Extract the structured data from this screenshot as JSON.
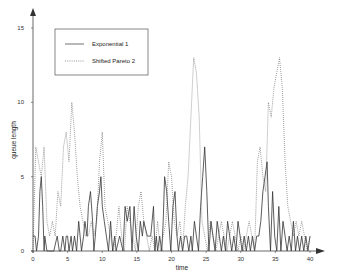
{
  "chart_data": {
    "type": "line",
    "title": "",
    "xlabel": "time",
    "ylabel": "queue length",
    "xlim": [
      0,
      40
    ],
    "ylim": [
      0,
      15
    ],
    "x_ticks": [
      "0",
      "5",
      "10",
      "15",
      "20",
      "25",
      "30",
      "35",
      "40"
    ],
    "y_ticks": [
      "0",
      "5",
      "10",
      "15"
    ],
    "grid": false,
    "legend_position": "upper-left",
    "series": [
      {
        "name": "Exponential 1",
        "style": "solid",
        "x": [
          0,
          0.3,
          0.5,
          0.8,
          1.0,
          1.2,
          1.4,
          1.6,
          1.7,
          2.0,
          2.2,
          2.4,
          2.6,
          3.0,
          3.5,
          3.8,
          4.0,
          4.3,
          4.6,
          4.8,
          5.0,
          5.2,
          5.5,
          5.7,
          6.0,
          6.3,
          6.6,
          6.8,
          7.0,
          7.3,
          7.5,
          7.8,
          8.0,
          8.3,
          8.6,
          8.8,
          9.0,
          9.3,
          9.6,
          9.8,
          10.0,
          10.3,
          10.6,
          10.9,
          11.2,
          11.5,
          11.8,
          12.0,
          12.5,
          13.0,
          13.3,
          13.6,
          14.0,
          14.3,
          14.6,
          14.9,
          15.2,
          15.5,
          15.8,
          16.0,
          16.5,
          17.0,
          17.4,
          17.6,
          17.8,
          18.0,
          18.3,
          18.6,
          18.8,
          19.0,
          19.3,
          19.6,
          19.9,
          20.2,
          20.5,
          20.8,
          21.0,
          21.3,
          21.6,
          21.9,
          22.2,
          22.5,
          22.8,
          23.0,
          23.3,
          23.6,
          23.9,
          24.2,
          24.5,
          24.8,
          25.1,
          25.4,
          25.7,
          26.0,
          26.3,
          26.6,
          26.9,
          27.2,
          27.5,
          27.8,
          28.1,
          28.4,
          28.7,
          29.0,
          29.3,
          29.6,
          29.9,
          30.2,
          30.5,
          30.8,
          31.1,
          31.4,
          31.7,
          32.0,
          32.3,
          32.6,
          32.9,
          33.2,
          33.5,
          33.8,
          34.0,
          34.3,
          34.6,
          34.9,
          35.2,
          35.5,
          35.8,
          36.1,
          36.4,
          36.7,
          37.0,
          37.3,
          37.6,
          37.9,
          38.2,
          38.5,
          38.8,
          39.1,
          39.4,
          39.7,
          40.0
        ],
        "values": [
          1,
          1,
          0,
          1,
          4,
          5,
          3,
          0,
          1,
          0,
          0,
          0,
          0,
          0,
          1,
          0,
          0,
          1,
          0,
          1,
          1,
          0,
          1,
          0,
          1,
          0,
          2,
          1,
          0,
          1,
          2,
          1,
          3,
          4,
          2,
          0,
          1,
          3,
          4,
          5,
          3,
          2,
          1,
          0,
          2,
          0,
          1,
          0,
          1,
          0,
          3,
          2,
          3,
          0,
          3,
          1,
          0,
          2,
          1,
          2,
          1,
          1,
          3,
          0,
          1,
          0,
          1,
          0,
          2,
          5,
          4,
          2,
          0,
          3,
          4,
          1,
          0,
          1,
          0,
          1,
          1,
          0,
          1,
          0,
          2,
          1,
          0,
          3,
          5,
          7,
          4,
          0,
          2,
          1,
          0,
          2,
          1,
          0,
          1,
          0,
          2,
          1,
          0,
          1,
          0,
          2,
          1,
          0,
          1,
          0,
          1,
          0,
          1,
          0,
          1,
          1,
          2,
          4,
          5,
          6,
          3,
          0,
          4,
          1,
          0,
          3,
          0,
          2,
          1,
          0,
          1,
          0,
          2,
          0,
          1,
          0,
          1,
          0,
          1,
          0,
          1
        ]
      },
      {
        "name": "Shifted Pareto 2",
        "style": "dotted",
        "x": [
          0,
          0.4,
          0.8,
          1.2,
          1.6,
          2.0,
          2.4,
          2.8,
          3.2,
          3.6,
          4.0,
          4.4,
          4.8,
          5.2,
          5.6,
          6.0,
          6.4,
          6.8,
          7.2,
          7.6,
          8.0,
          8.4,
          8.8,
          9.2,
          9.6,
          10.0,
          10.4,
          10.8,
          11.2,
          11.6,
          12.0,
          12.4,
          12.8,
          13.2,
          13.6,
          14.0,
          14.4,
          14.8,
          15.2,
          15.6,
          16.0,
          16.4,
          16.8,
          17.2,
          17.6,
          18.0,
          18.4,
          18.8,
          19.2,
          19.6,
          20.0,
          20.4,
          20.8,
          21.2,
          21.6,
          22.0,
          22.4,
          22.8,
          23.2,
          23.6,
          24.0,
          24.4,
          24.8,
          25.2,
          25.6,
          26.0,
          26.4,
          26.8,
          27.2,
          27.6,
          28.0,
          28.4,
          28.8,
          29.2,
          29.6,
          30.0,
          30.4,
          30.8,
          31.2,
          31.6,
          32.0,
          32.4,
          32.8,
          33.2,
          33.6,
          34.0,
          34.4,
          34.8,
          35.2,
          35.6,
          36.0,
          36.4,
          36.8,
          37.2,
          37.6,
          38.0,
          38.4,
          38.8,
          39.2,
          39.6,
          40.0
        ],
        "values": [
          0,
          7,
          6,
          5,
          7,
          2,
          1,
          2,
          1,
          4,
          3,
          7,
          8,
          6,
          10,
          8,
          5,
          3,
          2,
          1,
          1,
          2,
          1,
          2,
          6,
          8,
          3,
          2,
          1,
          0,
          1,
          3,
          1,
          0,
          3,
          2,
          1,
          0,
          3,
          4,
          2,
          1,
          0,
          1,
          0,
          2,
          0,
          1,
          2,
          6,
          5,
          2,
          1,
          2,
          0,
          3,
          5,
          9,
          13,
          12,
          9,
          2,
          1,
          0,
          2,
          1,
          0,
          1,
          2,
          1,
          0,
          1,
          2,
          1,
          0,
          1,
          0,
          1,
          2,
          1,
          0,
          6,
          7,
          5,
          4,
          10,
          9,
          11,
          12,
          13,
          11,
          6,
          3,
          2,
          1,
          2,
          1,
          2,
          1,
          0,
          1
        ]
      }
    ]
  },
  "legend": {
    "items": [
      {
        "label": "Exponential 1",
        "style": "solid"
      },
      {
        "label": "Shifted Pareto 2",
        "style": "dotted"
      }
    ]
  },
  "axes": {
    "xlabel": "time",
    "ylabel": "queue length",
    "x_ticks": [
      "0",
      "5",
      "10",
      "15",
      "20",
      "25",
      "30",
      "35",
      "40"
    ],
    "y_ticks": [
      "0",
      "5",
      "10",
      "15"
    ]
  },
  "colors": {
    "exponential": "#333333",
    "pareto": "#555555",
    "axis": "#444444"
  }
}
